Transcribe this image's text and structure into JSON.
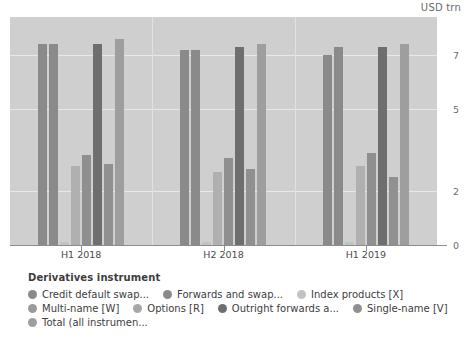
{
  "unit_label": "USD trn",
  "legend": {
    "title": "Derivatives instrument",
    "rows": [
      [
        {
          "label": "Credit default swap...",
          "color": "#8a8a8a"
        },
        {
          "label": "Forwards and swap...",
          "color": "#8a8a8a"
        },
        {
          "label": "Index products [X]",
          "color": "#c2c2c2"
        }
      ],
      [
        {
          "label": "Multi-name [W]",
          "color": "#9a9a9a"
        },
        {
          "label": "Options [R]",
          "color": "#a8a8a8"
        },
        {
          "label": "Outright forwards a...",
          "color": "#6e6e6e"
        },
        {
          "label": "Single-name [V]",
          "color": "#909090"
        }
      ],
      [
        {
          "label": "Total (all instrumen...",
          "color": "#9e9e9e"
        }
      ]
    ]
  },
  "chart_data": {
    "type": "bar",
    "title": "",
    "xlabel": "",
    "ylabel": "USD trn",
    "ylim": [
      0,
      8.4
    ],
    "yticks": [
      0,
      2,
      5,
      7
    ],
    "grid": true,
    "legend_position": "bottom",
    "categories": [
      "H1 2018",
      "H2 2018",
      "H1 2019"
    ],
    "series": [
      {
        "name": "Credit default swap...",
        "color": "#8a8a8a",
        "values": [
          7.4,
          7.2,
          7.0
        ]
      },
      {
        "name": "Forwards and swap...",
        "color": "#8a8a8a",
        "values": [
          7.4,
          7.2,
          7.3
        ]
      },
      {
        "name": "Index products [X]",
        "color": "#c2c2c2",
        "values": [
          0.1,
          0.1,
          0.1
        ]
      },
      {
        "name": "Multi-name [W]",
        "color": "#b0b0b0",
        "values": [
          2.9,
          2.7,
          2.9
        ]
      },
      {
        "name": "Options [R]",
        "color": "#8f8f8f",
        "values": [
          3.3,
          3.2,
          3.4
        ]
      },
      {
        "name": "Outright forwards a...",
        "color": "#6e6e6e",
        "values": [
          7.4,
          7.3,
          7.3
        ]
      },
      {
        "name": "Single-name [V]",
        "color": "#909090",
        "values": [
          3.0,
          2.8,
          2.5
        ]
      },
      {
        "name": "Total (all instrumen...",
        "color": "#9e9e9e",
        "values": [
          7.6,
          7.4,
          7.4
        ]
      }
    ]
  }
}
